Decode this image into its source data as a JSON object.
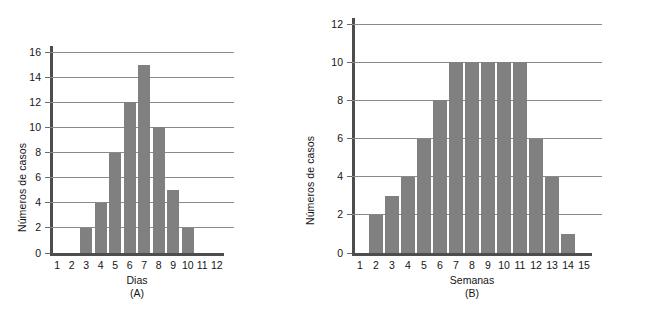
{
  "figure": {
    "background": "#ffffff",
    "bar_color": "#808080",
    "grid_color": "#8a8a8a",
    "axis_color": "#4d4d4d",
    "text_color": "#141414"
  },
  "chart_data": [
    {
      "type": "bar",
      "id": "A",
      "title": "",
      "caption": "(A)",
      "xlabel": "Dias",
      "ylabel": "Números de casos",
      "categories": [
        "1",
        "2",
        "3",
        "4",
        "5",
        "6",
        "7",
        "8",
        "9",
        "10",
        "11",
        "12"
      ],
      "values": [
        0,
        0,
        2,
        4,
        8,
        12,
        15,
        10,
        5,
        2,
        0,
        0
      ],
      "ylim": [
        0,
        16
      ],
      "yticks": [
        0,
        2,
        4,
        6,
        8,
        10,
        12,
        14,
        16
      ],
      "ytick_labels": [
        "0",
        "2",
        "4",
        "6",
        "8",
        "10",
        "12",
        "14",
        "16"
      ],
      "grid": true,
      "legend": "none"
    },
    {
      "type": "bar",
      "id": "B",
      "title": "",
      "caption": "(B)",
      "xlabel": "Semanas",
      "ylabel": "Números de casos",
      "categories": [
        "1",
        "2",
        "3",
        "4",
        "5",
        "6",
        "7",
        "8",
        "9",
        "10",
        "11",
        "12",
        "13",
        "14",
        "15"
      ],
      "values": [
        0,
        2,
        3,
        4,
        6,
        8,
        10,
        10,
        10,
        10,
        10,
        6,
        4,
        1,
        0
      ],
      "ylim": [
        0,
        12
      ],
      "yticks": [
        0,
        2,
        4,
        6,
        8,
        10,
        12
      ],
      "ytick_labels": [
        "0",
        "2",
        "4",
        "6",
        "8",
        "10",
        "12"
      ],
      "grid": true,
      "legend": "none"
    }
  ],
  "bottom_cut_text": ""
}
